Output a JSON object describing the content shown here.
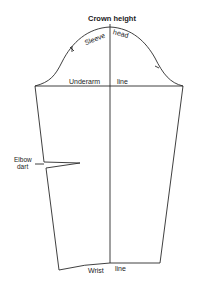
{
  "diagram": {
    "labels": {
      "crown_height": "Crown height",
      "sleeve": "Sleeve",
      "head": "head",
      "underarm": "Underarm",
      "underarm_line": "line",
      "elbow": "Elbow",
      "dart": "dart",
      "wrist": "Wrist",
      "wrist_line": "line"
    },
    "colors": {
      "line": "#2a2a2a",
      "background": "#ffffff"
    }
  }
}
